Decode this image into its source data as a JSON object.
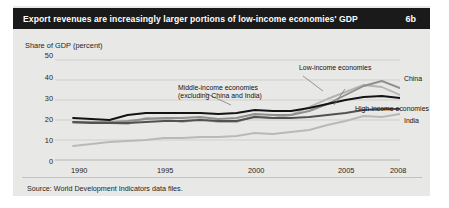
{
  "header": {
    "title": "Export revenues are increasingly larger portions of low-income economies' GDP",
    "figure_number": "6b"
  },
  "footer": {
    "source": "Source: World Development Indicators data files."
  },
  "colors": {
    "card_background": "#e8e8e6",
    "titlebar_background": "#1a1a1a",
    "titlebar_text": "#ffffff",
    "gridline": "#cfcfcd",
    "low_income": "#8f8f8f",
    "middle_income": "#141414",
    "high_income": "#525252",
    "china": "#b4b4b4",
    "india": "#b9b9b9"
  },
  "chart_data": {
    "type": "line",
    "title": "Export revenues are increasingly larger portions of low-income economies' GDP",
    "xlabel": "",
    "ylabel": "Share of GDP (percent)",
    "ylim": [
      0,
      50
    ],
    "xlim": [
      1989,
      2008
    ],
    "yticks": [
      0,
      10,
      20,
      30,
      40,
      50
    ],
    "ytick_labels": [
      "0",
      "10",
      "20",
      "30",
      "40",
      "50"
    ],
    "xticks": [
      1990,
      1995,
      2000,
      2005,
      2008
    ],
    "xtick_labels": [
      "1990",
      "1995",
      "2000",
      "2005",
      "2008"
    ],
    "grid": true,
    "legend": "inline-annotations",
    "x": [
      1990,
      1991,
      1992,
      1993,
      1994,
      1995,
      1996,
      1997,
      1998,
      1999,
      2000,
      2001,
      2002,
      2003,
      2004,
      2005,
      2006,
      2007,
      2008
    ],
    "series": [
      {
        "name": "Low-income economies",
        "color": "#8f8f8f",
        "values": [
          19.0,
          19.0,
          19.0,
          19.5,
          20.5,
          21.0,
          21.0,
          21.5,
          20.5,
          21.0,
          23.0,
          22.5,
          22.5,
          24.5,
          28.0,
          32.5,
          37.0,
          39.5,
          36.0
        ]
      },
      {
        "name": "Middle-income economies (excluding China and India)",
        "color": "#141414",
        "values": [
          21.0,
          20.5,
          20.0,
          22.5,
          23.5,
          23.5,
          23.5,
          23.5,
          23.0,
          23.5,
          25.0,
          24.5,
          24.5,
          26.0,
          28.0,
          30.0,
          31.5,
          32.0,
          31.0
        ]
      },
      {
        "name": "High-income economies",
        "color": "#525252",
        "values": [
          19.0,
          18.5,
          18.5,
          18.5,
          19.0,
          19.5,
          19.5,
          20.0,
          19.5,
          19.5,
          21.5,
          21.0,
          21.0,
          21.5,
          22.5,
          23.5,
          25.0,
          25.5,
          25.5
        ]
      },
      {
        "name": "China",
        "color": "#b4b4b4",
        "values": [
          18.5,
          18.5,
          18.5,
          18.0,
          21.0,
          20.5,
          19.0,
          20.5,
          19.0,
          19.0,
          22.0,
          21.0,
          22.5,
          26.5,
          30.5,
          34.0,
          37.5,
          36.5,
          32.5
        ]
      },
      {
        "name": "India",
        "color": "#b9b9b9",
        "values": [
          7.0,
          8.0,
          9.0,
          9.5,
          10.0,
          11.0,
          11.0,
          11.5,
          11.5,
          12.0,
          13.5,
          13.0,
          14.0,
          15.0,
          17.5,
          19.5,
          22.0,
          21.5,
          23.0
        ]
      }
    ],
    "annotations": [
      {
        "name": "low-income-label",
        "text": "Low-income economies"
      },
      {
        "name": "middle-income-label-line1",
        "text": "Middle-income economies"
      },
      {
        "name": "middle-income-label-line2",
        "text": "(excluding China and India)"
      },
      {
        "name": "china-label",
        "text": "China"
      },
      {
        "name": "high-income-label",
        "text": "High-income economies"
      },
      {
        "name": "india-label",
        "text": "India"
      }
    ]
  }
}
